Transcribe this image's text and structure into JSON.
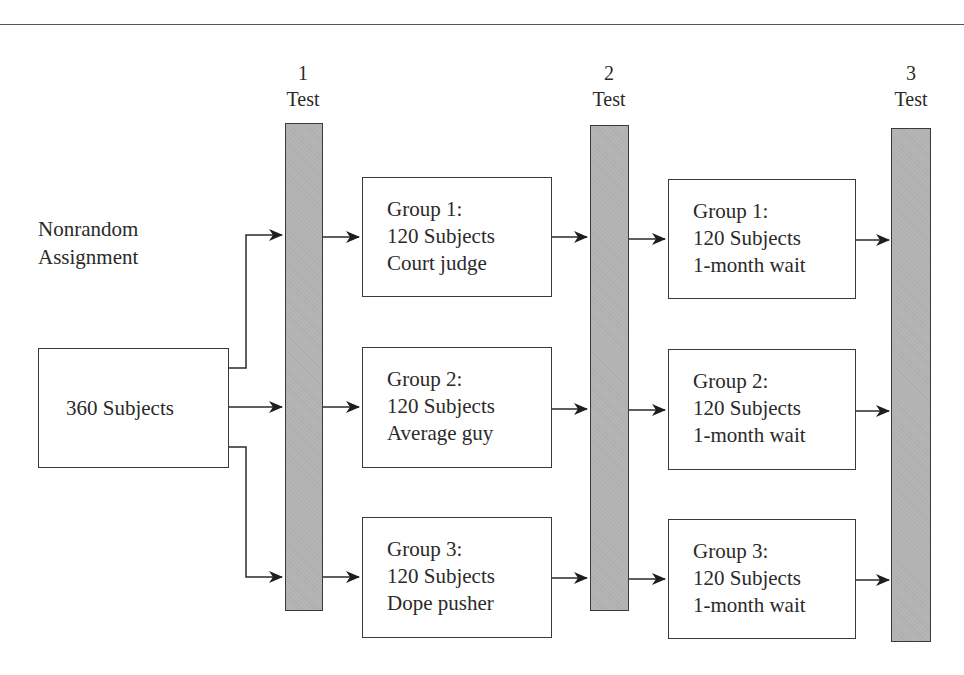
{
  "diagram": {
    "type": "experimental-design-flow",
    "assignment_label": [
      "Nonrandom",
      "Assignment"
    ],
    "source": {
      "label": "360 Subjects"
    },
    "tests": [
      {
        "number": "1",
        "label": "Test"
      },
      {
        "number": "2",
        "label": "Test"
      },
      {
        "number": "3",
        "label": "Test"
      }
    ],
    "treatment_groups": [
      {
        "name": "Group 1:",
        "count": "120 Subjects",
        "condition": "Court judge"
      },
      {
        "name": "Group 2:",
        "count": "120 Subjects",
        "condition": "Average guy"
      },
      {
        "name": "Group 3:",
        "count": "120 Subjects",
        "condition": "Dope pusher"
      }
    ],
    "wait_groups": [
      {
        "name": "Group 1:",
        "count": "120 Subjects",
        "condition": "1-month wait"
      },
      {
        "name": "Group 2:",
        "count": "120 Subjects",
        "condition": "1-month wait"
      },
      {
        "name": "Group 3:",
        "count": "120 Subjects",
        "condition": "1-month wait"
      }
    ],
    "colors": {
      "bar_fill": "#b5b5b5",
      "stroke": "#3a3a3a",
      "background": "#ffffff"
    }
  }
}
